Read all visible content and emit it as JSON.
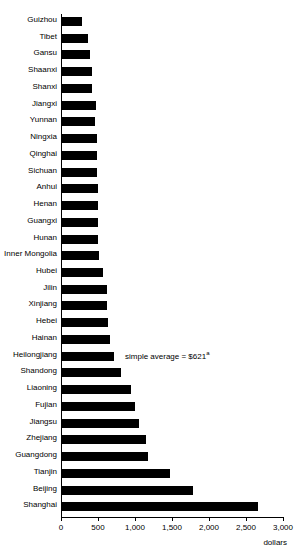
{
  "chart_data": {
    "type": "bar",
    "orientation": "horizontal",
    "title": "",
    "xlabel": "dollars",
    "ylabel": "",
    "xlim": [
      0,
      3000
    ],
    "xticks": [
      0,
      500,
      1000,
      1500,
      2000,
      2500,
      3000
    ],
    "xtick_labels": [
      "0",
      "500",
      "1,000",
      "1,500",
      "2,000",
      "2,500",
      "3,000"
    ],
    "grid": false,
    "legend": null,
    "annotations": [
      {
        "text": "simple average = $621",
        "superscript": "a",
        "x": 1000,
        "y_category": "Heilongjiang"
      }
    ],
    "categories": [
      "Guizhou",
      "Tibet",
      "Gansu",
      "Shaanxi",
      "Shanxi",
      "Jiangxi",
      "Yunnan",
      "Ningxia",
      "Qinghai",
      "Sichuan",
      "Anhui",
      "Henan",
      "Guangxi",
      "Hunan",
      "Inner Mongolia",
      "Hubei",
      "Jilin",
      "Xinjiang",
      "Hebei",
      "Hainan",
      "Heilongjiang",
      "Shandong",
      "Liaoning",
      "Fujian",
      "Jiangsu",
      "Zhejiang",
      "Guangdong",
      "Tianjin",
      "Beijing",
      "Shanghai"
    ],
    "values": [
      285,
      365,
      390,
      420,
      420,
      470,
      460,
      480,
      485,
      490,
      495,
      500,
      505,
      505,
      510,
      570,
      620,
      620,
      635,
      660,
      715,
      810,
      945,
      1000,
      1055,
      1150,
      1175,
      1470,
      1790,
      2660
    ]
  },
  "colors": {
    "bar": "#000000",
    "axis": "#000000",
    "background": "#ffffff",
    "text": "#000000"
  }
}
